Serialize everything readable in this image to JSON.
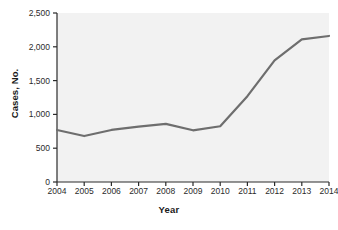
{
  "chart_data": {
    "type": "line",
    "title": "",
    "xlabel": "Year",
    "ylabel": "Cases, No.",
    "categories": [
      "2004",
      "2005",
      "2006",
      "2007",
      "2008",
      "2009",
      "2010",
      "2011",
      "2012",
      "2013",
      "2014"
    ],
    "x": [
      2004,
      2005,
      2006,
      2007,
      2008,
      2009,
      2010,
      2011,
      2012,
      2013,
      2014
    ],
    "values": [
      770,
      680,
      770,
      820,
      860,
      765,
      825,
      1270,
      1800,
      2110,
      2160
    ],
    "series": [
      {
        "name": "Cases",
        "values": [
          770,
          680,
          770,
          820,
          860,
          765,
          825,
          1270,
          1800,
          2110,
          2160
        ]
      }
    ],
    "ylim": [
      0,
      2500
    ],
    "xlim": [
      2004,
      2014
    ],
    "yticks": [
      0,
      500,
      1000,
      1500,
      2000,
      2500
    ],
    "ytick_labels": [
      "0",
      "500",
      "1,000",
      "1,500",
      "2,000",
      "2,500"
    ],
    "xticks": [
      2004,
      2005,
      2006,
      2007,
      2008,
      2009,
      2010,
      2011,
      2012,
      2013,
      2014
    ],
    "xtick_labels": [
      "2004",
      "2005",
      "2006",
      "2007",
      "2008",
      "2009",
      "2010",
      "2011",
      "2012",
      "2013",
      "2014"
    ],
    "grid": false,
    "legend": "none",
    "line_color": "#6e6e6e",
    "plot_background": "#f2f2f2",
    "axis_color": "#2b2b2b",
    "figure_background": "#ffffff"
  }
}
